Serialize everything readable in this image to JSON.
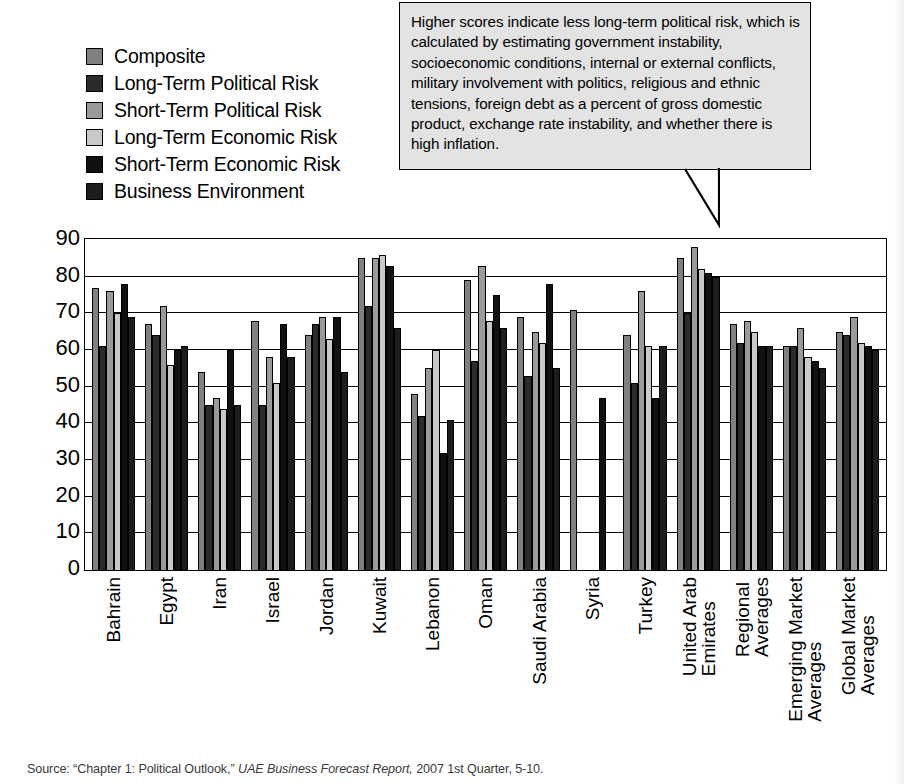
{
  "legend": {
    "items": [
      {
        "label": "Composite",
        "color": "#808080",
        "name": "composite"
      },
      {
        "label": "Long-Term Political Risk",
        "color": "#2b2b2b",
        "name": "long-term-political-risk"
      },
      {
        "label": "Short-Term Political Risk",
        "color": "#9a9a9a",
        "name": "short-term-political-risk"
      },
      {
        "label": "Long-Term Economic Risk",
        "color": "#c9c9c9",
        "name": "long-term-economic-risk"
      },
      {
        "label": "Short-Term Economic Risk",
        "color": "#111111",
        "name": "short-term-economic-risk"
      },
      {
        "label": "Business Environment",
        "color": "#1d1d1d",
        "name": "business-environment"
      }
    ]
  },
  "callout": {
    "text": "Higher scores indicate less long-term political risk, which is calculated by estimating government instability, socioeconomic conditions, internal or external conflicts, military involvement with politics, religious and ethnic tensions, foreign debt as a percent of gross domestic product, exchange rate instability, and whether there is high inflation."
  },
  "source": {
    "prefix": "Source: “Chapter 1: Political Outlook,” ",
    "italic": "UAE Business Forecast Report,",
    "suffix": " 2007 1st Quarter, 5-10."
  },
  "chart_data": {
    "type": "bar",
    "title": "",
    "xlabel": "",
    "ylabel": "",
    "ylim": [
      0,
      90
    ],
    "yticks": [
      90,
      80,
      70,
      60,
      50,
      40,
      30,
      20,
      10,
      0
    ],
    "grid": true,
    "legend_position": "top-left",
    "categories": [
      "Bahrain",
      "Egypt",
      "Iran",
      "Israel",
      "Jordan",
      "Kuwait",
      "Lebanon",
      "Oman",
      "Saudi Arabia",
      "Syria",
      "Turkey",
      "United Arab Emirates",
      "Regional Averages",
      "Emerging Market Averages",
      "Global Market Averages"
    ],
    "category_lines": [
      [
        "Bahrain"
      ],
      [
        "Egypt"
      ],
      [
        "Iran"
      ],
      [
        "Israel"
      ],
      [
        "Jordan"
      ],
      [
        "Kuwait"
      ],
      [
        "Lebanon"
      ],
      [
        "Oman"
      ],
      [
        "Saudi Arabia"
      ],
      [
        "Syria"
      ],
      [
        "Turkey"
      ],
      [
        "United Arab",
        "Emirates"
      ],
      [
        "Regional",
        "Averages"
      ],
      [
        "Emerging Market",
        "Averages"
      ],
      [
        "Global Market",
        "Averages"
      ]
    ],
    "series": [
      {
        "name": "Composite",
        "color": "#808080",
        "values": [
          77,
          67,
          54,
          68,
          64,
          85,
          48,
          79,
          69,
          71,
          64,
          85,
          67,
          61,
          65
        ]
      },
      {
        "name": "Long-Term Political Risk",
        "color": "#2b2b2b",
        "values": [
          61,
          64,
          45,
          45,
          67,
          72,
          42,
          57,
          53,
          0,
          51,
          70,
          62,
          61,
          64
        ]
      },
      {
        "name": "Short-Term Political Risk",
        "color": "#9a9a9a",
        "values": [
          76,
          72,
          47,
          58,
          69,
          85,
          55,
          83,
          65,
          0,
          76,
          88,
          68,
          66,
          69
        ]
      },
      {
        "name": "Long-Term Economic Risk",
        "color": "#c9c9c9",
        "values": [
          70,
          56,
          44,
          51,
          63,
          86,
          60,
          68,
          62,
          0,
          61,
          82,
          65,
          58,
          62
        ]
      },
      {
        "name": "Short-Term Economic Risk",
        "color": "#111111",
        "values": [
          78,
          60,
          60,
          67,
          69,
          83,
          32,
          75,
          78,
          47,
          47,
          81,
          61,
          57,
          61
        ]
      },
      {
        "name": "Business Environment",
        "color": "#1d1d1d",
        "values": [
          69,
          61,
          45,
          58,
          54,
          66,
          41,
          66,
          55,
          0,
          61,
          80,
          61,
          55,
          60
        ]
      }
    ]
  }
}
